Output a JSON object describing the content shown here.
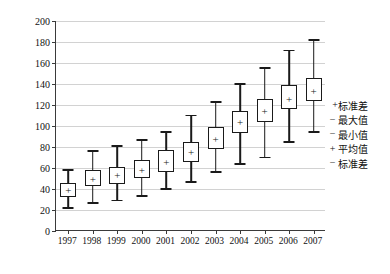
{
  "chart_data": {
    "type": "box",
    "title": "",
    "xlabel": "",
    "ylabel": "总电耗（亿 kWh）",
    "ylim": [
      0,
      200
    ],
    "yticks": [
      0,
      20,
      40,
      60,
      80,
      100,
      120,
      140,
      160,
      180,
      200
    ],
    "grid": true,
    "categories": [
      "1997",
      "1998",
      "1999",
      "2000",
      "2001",
      "2002",
      "2003",
      "2004",
      "2005",
      "2006",
      "2007"
    ],
    "legend_position": "right",
    "legend": [
      {
        "symbol": "+",
        "label": "标准差"
      },
      {
        "symbol": "−",
        "label": "最大值"
      },
      {
        "symbol": "−",
        "label": "最小值"
      },
      {
        "symbol": "+",
        "label": "平均值"
      },
      {
        "symbol": "−",
        "label": "标准差"
      }
    ],
    "series_note": "box = mean ± standard deviation; whiskers = min / max; + = mean",
    "boxes": [
      {
        "category": "1997",
        "min": 22,
        "sd_low": 32,
        "mean": 39,
        "sd_high": 46,
        "max": 58
      },
      {
        "category": "1998",
        "min": 27,
        "sd_low": 43,
        "mean": 50,
        "sd_high": 58,
        "max": 76
      },
      {
        "category": "1999",
        "min": 29,
        "sd_low": 45,
        "mean": 53,
        "sd_high": 61,
        "max": 81
      },
      {
        "category": "2000",
        "min": 33,
        "sd_low": 50,
        "mean": 58,
        "sd_high": 68,
        "max": 87
      },
      {
        "category": "2001",
        "min": 40,
        "sd_low": 56,
        "mean": 66,
        "sd_high": 77,
        "max": 94
      },
      {
        "category": "2002",
        "min": 47,
        "sd_low": 66,
        "mean": 75,
        "sd_high": 85,
        "max": 110
      },
      {
        "category": "2003",
        "min": 56,
        "sd_low": 78,
        "mean": 88,
        "sd_high": 99,
        "max": 123
      },
      {
        "category": "2004",
        "min": 64,
        "sd_low": 93,
        "mean": 104,
        "sd_high": 114,
        "max": 140
      },
      {
        "category": "2005",
        "min": 70,
        "sd_low": 104,
        "mean": 114,
        "sd_high": 126,
        "max": 155
      },
      {
        "category": "2006",
        "min": 85,
        "sd_low": 116,
        "mean": 126,
        "sd_high": 139,
        "max": 172
      },
      {
        "category": "2007",
        "min": 94,
        "sd_low": 124,
        "mean": 133,
        "sd_high": 146,
        "max": 182
      }
    ]
  }
}
